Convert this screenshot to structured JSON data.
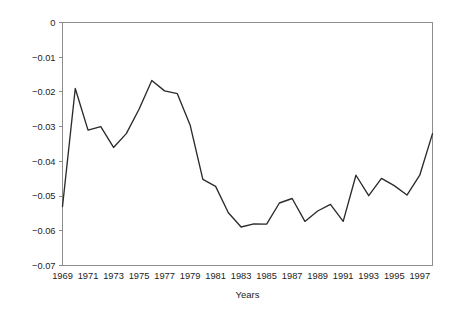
{
  "chart_data": {
    "type": "line",
    "title": "",
    "subtitle": "",
    "xlabel": "Years",
    "ylabel": "",
    "xlim": [
      1969,
      1998
    ],
    "ylim": [
      -0.07,
      0
    ],
    "grid": false,
    "legend": false,
    "legend_position": "none",
    "line_color": "#2b2b2b",
    "axis_color": "#8d8d8d",
    "background_color": "#ffffff",
    "x_tick_labels": [
      "1969",
      "1971",
      "1973",
      "1975",
      "1977",
      "1979",
      "1981",
      "1983",
      "1985",
      "1987",
      "1989",
      "1991",
      "1993",
      "1995",
      "1997"
    ],
    "x_tick_values": [
      1969,
      1971,
      1973,
      1975,
      1977,
      1979,
      1981,
      1983,
      1985,
      1987,
      1989,
      1991,
      1993,
      1995,
      1997
    ],
    "y_tick_labels": [
      "0",
      "−0.01",
      "−0.02",
      "−0.03",
      "−0.04",
      "−0.05",
      "−0.06",
      "−0.07"
    ],
    "y_tick_values": [
      0,
      -0.01,
      -0.02,
      -0.03,
      -0.04,
      -0.05,
      -0.06,
      -0.07
    ],
    "x": [
      1969,
      1970,
      1971,
      1972,
      1973,
      1974,
      1975,
      1976,
      1977,
      1978,
      1979,
      1980,
      1981,
      1982,
      1983,
      1984,
      1985,
      1986,
      1987,
      1988,
      1989,
      1990,
      1991,
      1992,
      1993,
      1994,
      1995,
      1996,
      1997,
      1998
    ],
    "values": [
      -0.053,
      -0.019,
      -0.031,
      -0.03,
      -0.036,
      -0.032,
      -0.025,
      -0.0167,
      -0.0197,
      -0.0205,
      -0.0295,
      -0.0452,
      -0.0472,
      -0.0548,
      -0.0589,
      -0.058,
      -0.0581,
      -0.052,
      -0.0507,
      -0.0573,
      -0.0543,
      -0.0524,
      -0.0573,
      -0.044,
      -0.0499,
      -0.0449,
      -0.047,
      -0.0497,
      -0.044,
      -0.032
    ],
    "series": [
      {
        "name": "series-1",
        "values": [
          -0.053,
          -0.019,
          -0.031,
          -0.03,
          -0.036,
          -0.032,
          -0.025,
          -0.0167,
          -0.0197,
          -0.0205,
          -0.0295,
          -0.0452,
          -0.0472,
          -0.0548,
          -0.0589,
          -0.058,
          -0.0581,
          -0.052,
          -0.0507,
          -0.0573,
          -0.0543,
          -0.0524,
          -0.0573,
          -0.044,
          -0.0499,
          -0.0449,
          -0.047,
          -0.0497,
          -0.044,
          -0.032
        ]
      }
    ]
  },
  "axes": {
    "x_title": "Years"
  }
}
